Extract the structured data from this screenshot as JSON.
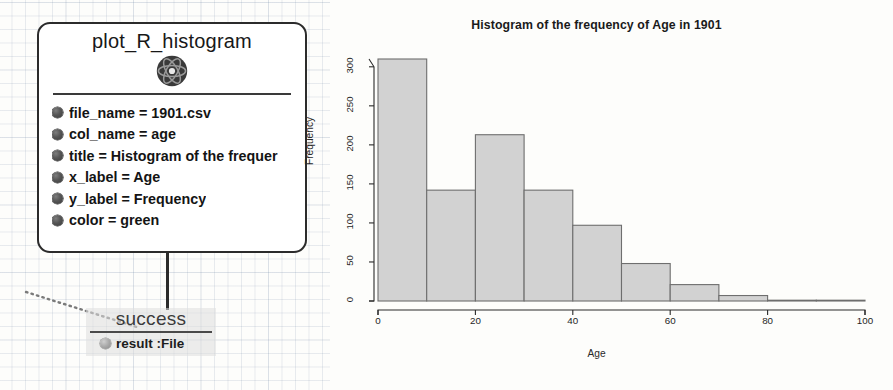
{
  "node": {
    "title": "plot_R_histogram",
    "icon": "atom-icon",
    "params": [
      {
        "label": "file_name = 1901.csv"
      },
      {
        "label": "col_name = age"
      },
      {
        "label": "title = Histogram of the frequer"
      },
      {
        "label": "x_label = Age"
      },
      {
        "label": "y_label = Frequency"
      },
      {
        "label": "color = green"
      }
    ]
  },
  "success": {
    "label": "success",
    "result_label": "result :File"
  },
  "chart_data": {
    "type": "bar",
    "title": "Histogram of the frequency of Age in 1901",
    "xlabel": "Age",
    "ylabel": "Frequency",
    "categories": [
      "0-10",
      "10-20",
      "20-30",
      "30-40",
      "40-50",
      "50-60",
      "60-70",
      "70-80",
      "80-90",
      "90-100"
    ],
    "bin_edges": [
      0,
      10,
      20,
      30,
      40,
      50,
      60,
      70,
      80,
      90,
      100
    ],
    "values": [
      310,
      142,
      213,
      142,
      97,
      48,
      21,
      7,
      1,
      0
    ],
    "xlim": [
      0,
      100
    ],
    "ylim": [
      0,
      310
    ],
    "xticks": [
      0,
      20,
      40,
      60,
      80,
      100
    ],
    "yticks": [
      0,
      50,
      100,
      150,
      200,
      250,
      300
    ],
    "grid": false,
    "legend": null,
    "bar_fill": "#d2d2d2",
    "bar_stroke": "#6e6e6e"
  }
}
